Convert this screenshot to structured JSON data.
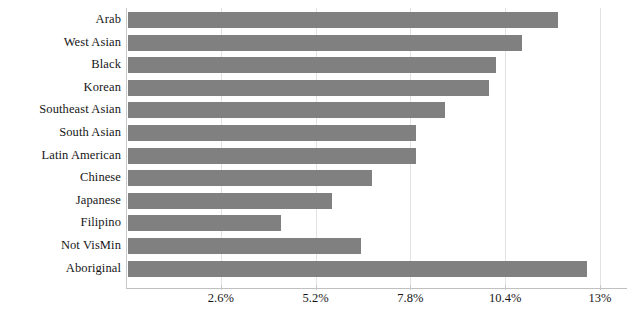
{
  "chart_data": {
    "type": "bar",
    "orientation": "horizontal",
    "title": "",
    "subtitle": "",
    "xlabel": "",
    "ylabel": "",
    "grid": true,
    "legend": null,
    "bar_color": "#808080",
    "axis_color": "#c8c8c8",
    "gridline_color": "#e2e2e2",
    "xlim": [
      0,
      13
    ],
    "xtick_labels": [
      "2.6%",
      "5.2%",
      "7.8%",
      "10.4%",
      "13%"
    ],
    "xtick_values": [
      2.6,
      5.2,
      7.8,
      10.4,
      13
    ],
    "categories": [
      "Arab",
      "West Asian",
      "Black",
      "Korean",
      "Southeast Asian",
      "South Asian",
      "Latin American",
      "Chinese",
      "Japanese",
      "Filipino",
      "Not VisMin",
      "Aboriginal"
    ],
    "values": [
      11.8,
      10.8,
      10.1,
      9.9,
      8.7,
      7.9,
      7.9,
      6.7,
      5.6,
      4.2,
      6.4,
      12.6
    ]
  }
}
